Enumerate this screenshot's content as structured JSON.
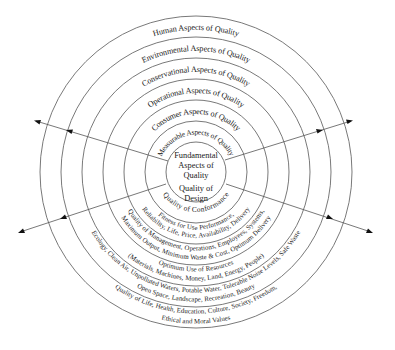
{
  "diagram": {
    "title": "Aspects of Quality",
    "center": {
      "line1": "Fundamental",
      "line2": "Aspects of",
      "line3": "Quality",
      "line4": "Quality of",
      "line5": "Design"
    },
    "rings_top": [
      "Measurable Aspects of Quality",
      "Consumer Aspects of Quality",
      "Operational Aspects of Quality",
      "Conservational Aspects of Quality",
      "Environmental Aspects of Quality",
      "Human Aspects of Quality"
    ],
    "rings_bottom": {
      "measurable": [
        "Quality of Conformance"
      ],
      "consumer": [
        "Fitness for Use Performance,",
        "Reliability, Life, Price, Availability, Delivery"
      ],
      "operational": [
        "Quality of Management, Operations, Employees, Systems,",
        "Maximum Output, Minimum Waste & Cost, Optimum Delivery"
      ],
      "conservational": [
        "Optimum Use of Resources",
        "(Materials, Machines, Money, Land, Energy, People)"
      ],
      "environmental": [
        "Ecology, Clean Air, Unpolluted Waters, Potable Water, Tolerable Noise Levels, Safe Waste",
        "Open Space, Landscape, Recreation, Beauty"
      ],
      "human": [
        "Quality of Life, Health, Education, Culture, Society, Freedom,",
        "Ethical and Moral Values"
      ]
    },
    "arrows": [
      "upper-left",
      "upper-right",
      "lower-left",
      "lower-right"
    ],
    "colors": {
      "line": "#6a6a6a",
      "text": "#1a1a1a",
      "background": "#ffffff"
    }
  }
}
